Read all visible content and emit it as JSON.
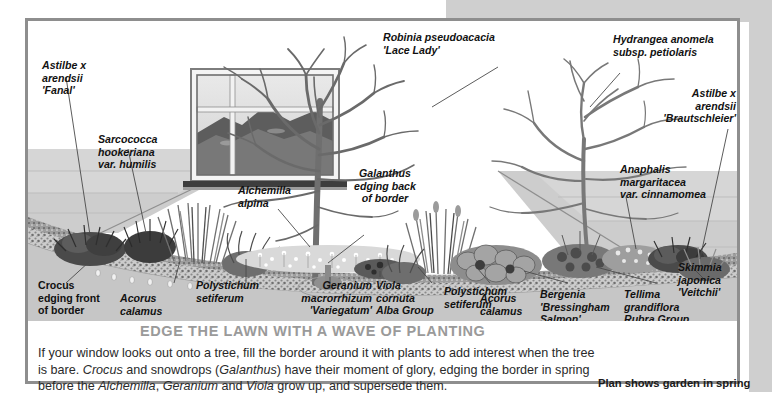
{
  "plate": {
    "headline": "EDGE THE LAWN WITH A WAVE OF PLANTING",
    "body_line1": "If your window looks out onto a tree, fill the border around it with plants to add interest when",
    "body_line2_a": "the tree is bare. ",
    "body_line2_b": "Crocus",
    "body_line2_c": " and snowdrops (",
    "body_line2_d": "Galanthus",
    "body_line2_e": ") have their moment of glory, edging the border",
    "body_line3_a": "in spring before the ",
    "body_line3_b": "Alchemilla",
    "body_line3_c": ", ",
    "body_line3_d": "Geranium",
    "body_line3_e": " and ",
    "body_line3_f": "Viola",
    "body_line3_g": " grow up, and supersede them.",
    "plan_note": "Plan shows garden in spring"
  },
  "labels": [
    {
      "id": "astilbe-fanal",
      "text": "Astilbe x\narendsii\n'Fanal'"
    },
    {
      "id": "sarcococca",
      "text": "Sarcococca\nhookeriana\nvar. humilis"
    },
    {
      "id": "alchemilla-alpina",
      "text": "Alchemilla\nalpina"
    },
    {
      "id": "galanthus-back",
      "text": "Galanthus\nedging back\nof border"
    },
    {
      "id": "robinia",
      "text": "Robinia pseudoacacia\n'Lace Lady'"
    },
    {
      "id": "hydrangea",
      "text": "Hydrangea anomela\nsubsp. petiolaris"
    },
    {
      "id": "astilbe-brautschleier",
      "text": "Astilbe x\narendsii\n'Brautschleier'"
    },
    {
      "id": "anaphalis",
      "text": "Anaphalis\nmargaritacea\nvar. cinnamomea"
    },
    {
      "id": "crocus-front",
      "text": "Crocus\nedging front\nof border"
    },
    {
      "id": "acorus-left",
      "text": "Acorus\ncalamus"
    },
    {
      "id": "polystichum-left",
      "text": "Polystichum\nsetiferum"
    },
    {
      "id": "geranium",
      "text": "Geranium\nmacrorrhizum\n'Variegatum'"
    },
    {
      "id": "viola",
      "text": "Viola\ncornuta\nAlba Group"
    },
    {
      "id": "polystichum-right",
      "text": "Polystichum\nsetiferum"
    },
    {
      "id": "acorus-right",
      "text": "Acorus\ncalamus"
    },
    {
      "id": "bergenia",
      "text": "Bergenia\n'Bressingham\nSalmon'"
    },
    {
      "id": "tellima",
      "text": "Tellima\ngrandiflora\nRubra Group"
    },
    {
      "id": "skimmia",
      "text": "Skimmia\njaponica\n'Veitchii'"
    }
  ],
  "colors": {
    "frame": "#8e8e8e",
    "headline": "#9a9a9a",
    "band": "#cfcfcf",
    "lawn": "#c9c9c9",
    "paving": "#bfbfbf",
    "soil": "#9a9a9a"
  },
  "illustration": {
    "scene": "garden-border-plan-with-window-and-tree",
    "window": "sash-window-with-landscape-view",
    "tree": "bare-deciduous-tree",
    "shrub": "bare-climbing-shrub"
  }
}
